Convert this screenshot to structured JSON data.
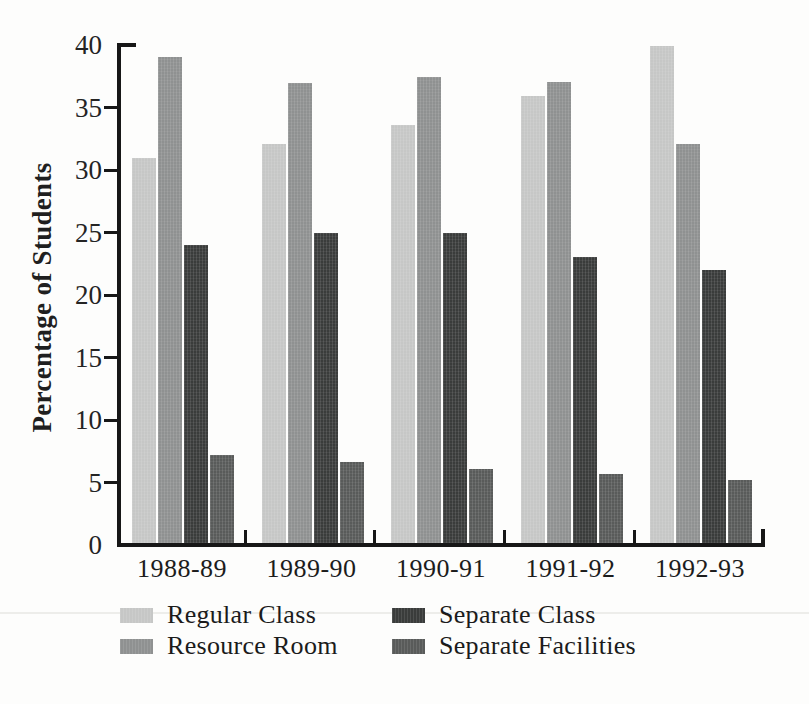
{
  "chart_data": {
    "type": "bar",
    "title": "",
    "xlabel": "",
    "ylabel": "Percentage of Students",
    "ylim": [
      0,
      40
    ],
    "ytick_step": 5,
    "ytick_labels": [
      "0",
      "5",
      "10",
      "15",
      "20",
      "25",
      "30",
      "35",
      "40"
    ],
    "grid": false,
    "legend_position": "bottom",
    "categories": [
      "1988-89",
      "1989-90",
      "1990-91",
      "1991-92",
      "1992-93"
    ],
    "series": [
      {
        "name": "Regular Class",
        "color": "#c6c7c6",
        "values": [
          30.8,
          31.9,
          33.4,
          35.8,
          39.8
        ]
      },
      {
        "name": "Resource Room",
        "color": "#8f9191",
        "values": [
          38.9,
          36.8,
          37.3,
          36.9,
          31.9
        ]
      },
      {
        "name": "Separate Class",
        "color": "#3a3c3b",
        "values": [
          23.8,
          24.8,
          24.8,
          22.9,
          21.8
        ]
      },
      {
        "name": "Separate Facilities",
        "color": "#595b5a",
        "values": [
          7.0,
          6.5,
          5.9,
          5.5,
          5.0
        ]
      }
    ],
    "legend_columns": [
      [
        "Regular Class",
        "Resource Room"
      ],
      [
        "Separate Class",
        "Separate Facilities"
      ]
    ]
  },
  "colors": {
    "axis": "#171717",
    "text": "#1b1b1b",
    "background": "#fdfdfc"
  }
}
